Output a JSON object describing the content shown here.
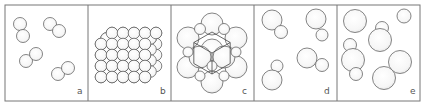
{
  "figure": {
    "frame": {
      "x": 5,
      "y": 5,
      "width": 415,
      "height": 96
    },
    "border_color": "#777777",
    "stroke_color": "#666666",
    "fill_color": "#f7f7f7",
    "dividers_x": [
      88,
      171,
      254,
      337
    ]
  },
  "panels": [
    {
      "id": "a",
      "label": "a",
      "description": "diatomic molecules of a single element",
      "label_pos": {
        "x": 77,
        "y": 94
      },
      "circles": [
        {
          "cx": 20,
          "cy": 24,
          "r": 6.5
        },
        {
          "cx": 23,
          "cy": 36,
          "r": 6.5
        },
        {
          "cx": 50,
          "cy": 24,
          "r": 6.5
        },
        {
          "cx": 59,
          "cy": 31,
          "r": 6.5
        },
        {
          "cx": 26,
          "cy": 61,
          "r": 6.5
        },
        {
          "cx": 36,
          "cy": 54,
          "r": 6.5
        },
        {
          "cx": 58,
          "cy": 74,
          "r": 6.5
        },
        {
          "cx": 68,
          "cy": 68,
          "r": 6.5
        }
      ]
    },
    {
      "id": "b",
      "label": "b",
      "description": "close-packed lattice of atoms",
      "label_pos": {
        "x": 160,
        "y": 94
      },
      "lattice": {
        "front_x0": 101,
        "front_y0": 44,
        "spacing": 11,
        "cols": 5,
        "rows": 4,
        "r": 5.8,
        "depth_layers": 3,
        "depth_dx": 5.5,
        "depth_dy": -5.5
      }
    },
    {
      "id": "c",
      "label": "c",
      "description": "face-centered cubic unit cell",
      "label_pos": {
        "x": 242,
        "y": 94
      },
      "cube": {
        "cx": 212,
        "cy": 53,
        "s": 21
      },
      "circles": [
        {
          "cx": 212,
          "cy": 24,
          "r": 11
        },
        {
          "cx": 188,
          "cy": 38,
          "r": 11
        },
        {
          "cx": 236,
          "cy": 38,
          "r": 11
        },
        {
          "cx": 212,
          "cy": 50,
          "r": 11
        },
        {
          "cx": 188,
          "cy": 67,
          "r": 11
        },
        {
          "cx": 236,
          "cy": 67,
          "r": 11
        },
        {
          "cx": 212,
          "cy": 82,
          "r": 11
        },
        {
          "cx": 200,
          "cy": 29,
          "r": 5.5
        },
        {
          "cx": 224,
          "cy": 29,
          "r": 5.5
        },
        {
          "cx": 200,
          "cy": 57,
          "r": 11
        },
        {
          "cx": 224,
          "cy": 57,
          "r": 11
        },
        {
          "cx": 188,
          "cy": 52,
          "r": 5
        },
        {
          "cx": 236,
          "cy": 52,
          "r": 5
        },
        {
          "cx": 212,
          "cy": 66,
          "r": 5
        },
        {
          "cx": 200,
          "cy": 76,
          "r": 5
        },
        {
          "cx": 224,
          "cy": 76,
          "r": 5
        }
      ]
    },
    {
      "id": "d",
      "label": "d",
      "description": "molecules of a compound with one large and one small atom",
      "label_pos": {
        "x": 324,
        "y": 94
      },
      "circles": [
        {
          "cx": 272,
          "cy": 20,
          "r": 10,
          "size": "large"
        },
        {
          "cx": 281,
          "cy": 32,
          "r": 6.5,
          "size": "small"
        },
        {
          "cx": 316,
          "cy": 19,
          "r": 10,
          "size": "large"
        },
        {
          "cx": 322,
          "cy": 35,
          "r": 6,
          "size": "small"
        },
        {
          "cx": 307,
          "cy": 58,
          "r": 10,
          "size": "large"
        },
        {
          "cx": 322,
          "cy": 65,
          "r": 6.5,
          "size": "small"
        },
        {
          "cx": 277,
          "cy": 66,
          "r": 6,
          "size": "small"
        },
        {
          "cx": 272,
          "cy": 80,
          "r": 10,
          "size": "large"
        }
      ]
    },
    {
      "id": "e",
      "label": "e",
      "description": "mixture of compound molecules and free atoms",
      "label_pos": {
        "x": 410,
        "y": 94
      },
      "circles": [
        {
          "cx": 355,
          "cy": 21,
          "r": 11.5
        },
        {
          "cx": 404,
          "cy": 16,
          "r": 7
        },
        {
          "cx": 382,
          "cy": 28,
          "r": 6.5
        },
        {
          "cx": 380,
          "cy": 40,
          "r": 11.5
        },
        {
          "cx": 350,
          "cy": 45,
          "r": 6.5
        },
        {
          "cx": 353,
          "cy": 60,
          "r": 11.5
        },
        {
          "cx": 356,
          "cy": 74,
          "r": 6.5
        },
        {
          "cx": 400,
          "cy": 62,
          "r": 11.5
        },
        {
          "cx": 384,
          "cy": 78,
          "r": 11.5
        }
      ]
    }
  ]
}
